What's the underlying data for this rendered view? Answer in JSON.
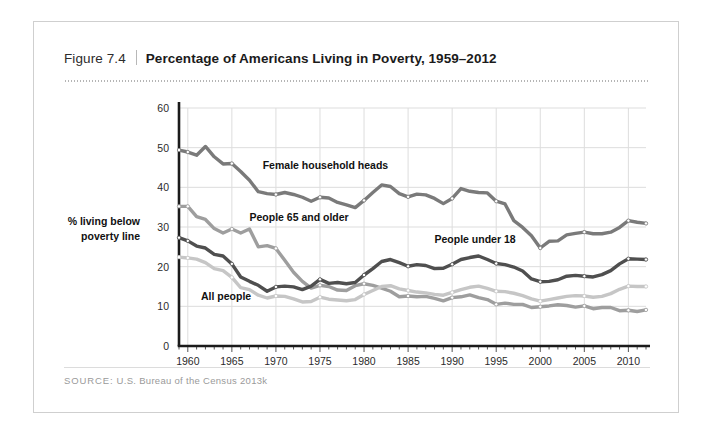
{
  "figure": {
    "number": "Figure 7.4",
    "title": "Percentage of Americans Living in Poverty, 1959–2012",
    "source_label": "SOURCE:",
    "source_text": "U.S. Bureau of the Census 2013k"
  },
  "chart_data": {
    "type": "line",
    "title": "Percentage of Americans Living in Poverty, 1959–2012",
    "xlabel": "",
    "ylabel": "% living below poverty line",
    "xlim": [
      1959,
      2012
    ],
    "ylim": [
      0,
      60
    ],
    "grid": true,
    "legend_position": "inline-annotations",
    "ytick_labels": [
      "0",
      "10",
      "20",
      "30",
      "40",
      "50",
      "60"
    ],
    "yticks": [
      0,
      10,
      20,
      30,
      40,
      50,
      60
    ],
    "xtick_labels": [
      "1960",
      "1965",
      "1970",
      "1975",
      "1980",
      "1985",
      "1990",
      "1995",
      "2000",
      "2005",
      "2010"
    ],
    "xticks": [
      1960,
      1965,
      1970,
      1975,
      1980,
      1985,
      1990,
      1995,
      2000,
      2005,
      2010
    ],
    "x": [
      1959,
      1960,
      1961,
      1962,
      1963,
      1964,
      1965,
      1966,
      1967,
      1968,
      1969,
      1970,
      1971,
      1972,
      1973,
      1974,
      1975,
      1976,
      1977,
      1978,
      1979,
      1980,
      1981,
      1982,
      1983,
      1984,
      1985,
      1986,
      1987,
      1988,
      1989,
      1990,
      1991,
      1992,
      1993,
      1994,
      1995,
      1996,
      1997,
      1998,
      1999,
      2000,
      2001,
      2002,
      2003,
      2004,
      2005,
      2006,
      2007,
      2008,
      2009,
      2010,
      2011,
      2012
    ],
    "series": [
      {
        "name": "Female household heads",
        "color": "#7a7a7a",
        "label_x": 1968.5,
        "label_y": 44.5,
        "values": [
          49.4,
          48.9,
          48.1,
          50.3,
          47.7,
          45.9,
          46.0,
          44.0,
          41.8,
          38.9,
          38.4,
          38.2,
          38.7,
          38.2,
          37.5,
          36.5,
          37.5,
          37.3,
          36.2,
          35.6,
          34.9,
          36.7,
          38.7,
          40.6,
          40.2,
          38.4,
          37.6,
          38.3,
          38.1,
          37.2,
          35.9,
          37.2,
          39.7,
          39.0,
          38.7,
          38.6,
          36.5,
          35.8,
          31.6,
          29.9,
          27.8,
          24.7,
          26.4,
          26.5,
          28.0,
          28.4,
          28.7,
          28.3,
          28.3,
          28.7,
          29.9,
          31.6,
          31.2,
          30.9
        ]
      },
      {
        "name": "People 65 and older",
        "color": "#9e9e9e",
        "label_x": 1967.0,
        "label_y": 31.5,
        "values": [
          35.2,
          35.2,
          32.6,
          31.9,
          29.6,
          28.5,
          29.5,
          28.5,
          29.5,
          25.0,
          25.3,
          24.6,
          21.6,
          18.6,
          16.3,
          14.6,
          15.3,
          15.0,
          14.1,
          14.0,
          15.2,
          15.7,
          15.3,
          14.6,
          13.8,
          12.4,
          12.6,
          12.4,
          12.5,
          12.0,
          11.4,
          12.2,
          12.4,
          12.9,
          12.2,
          11.7,
          10.5,
          10.8,
          10.5,
          10.5,
          9.7,
          9.9,
          10.1,
          10.4,
          10.2,
          9.8,
          10.1,
          9.4,
          9.7,
          9.7,
          8.9,
          9.0,
          8.7,
          9.1
        ]
      },
      {
        "name": "People under 18",
        "color": "#4f4f4f",
        "label_x": 1988.0,
        "label_y": 26.0,
        "values": [
          27.3,
          26.5,
          25.2,
          24.7,
          23.1,
          22.7,
          20.7,
          17.4,
          16.3,
          15.3,
          13.8,
          14.9,
          15.1,
          14.9,
          14.2,
          15.1,
          16.8,
          15.8,
          16.0,
          15.7,
          16.0,
          17.9,
          19.5,
          21.3,
          21.8,
          21.0,
          20.1,
          20.5,
          20.3,
          19.5,
          19.6,
          20.6,
          21.8,
          22.3,
          22.7,
          21.8,
          20.8,
          20.5,
          19.9,
          18.9,
          16.9,
          16.2,
          16.3,
          16.7,
          17.6,
          17.8,
          17.6,
          17.4,
          18.0,
          19.0,
          20.7,
          22.0,
          21.9,
          21.8
        ]
      },
      {
        "name": "All people",
        "color": "#c6c6c6",
        "label_x": 1961.5,
        "label_y": 11.5,
        "values": [
          22.4,
          22.2,
          21.9,
          21.0,
          19.5,
          19.0,
          17.3,
          14.7,
          14.2,
          12.8,
          12.1,
          12.6,
          12.5,
          11.9,
          11.1,
          11.2,
          12.3,
          11.8,
          11.6,
          11.4,
          11.7,
          13.0,
          14.0,
          15.0,
          15.2,
          14.4,
          14.0,
          13.6,
          13.4,
          13.0,
          12.8,
          13.5,
          14.2,
          14.8,
          15.1,
          14.5,
          13.8,
          13.7,
          13.3,
          12.7,
          11.9,
          11.3,
          11.7,
          12.1,
          12.5,
          12.7,
          12.6,
          12.3,
          12.5,
          13.2,
          14.3,
          15.1,
          15.0,
          15.0
        ]
      }
    ]
  }
}
